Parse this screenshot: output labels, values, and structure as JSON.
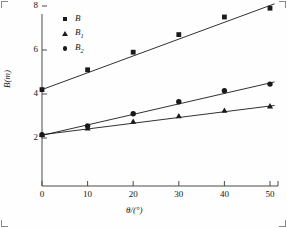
{
  "chart_data": {
    "type": "scatter",
    "title": "",
    "xlabel": "θ/(°)",
    "ylabel": "B(m)",
    "x": [
      0,
      10,
      20,
      30,
      40,
      50
    ],
    "xlim": [
      0,
      52
    ],
    "ylim": [
      1.0,
      8.4
    ],
    "xticks": [
      "0",
      "10",
      "20",
      "30",
      "40",
      "50"
    ],
    "yticks": [
      "2",
      "4",
      "6",
      "8"
    ],
    "ytick_values": [
      2,
      4,
      6,
      8
    ],
    "grid": false,
    "legend_position": "top-left",
    "series": [
      {
        "name": "B",
        "label": "B",
        "sub": "",
        "marker": "square",
        "color": "#1a1a1a",
        "values": [
          4.2,
          5.1,
          5.9,
          6.7,
          7.5,
          7.9
        ],
        "fit_start": 4.2,
        "fit_end": 8.1
      },
      {
        "name": "B1",
        "label": "B",
        "sub": "1",
        "marker": "triangle",
        "color": "#1a1a1a",
        "values": [
          2.15,
          2.45,
          2.75,
          3.0,
          3.25,
          3.45
        ],
        "fit_start": 2.15,
        "fit_end": 3.48
      },
      {
        "name": "B2",
        "label": "B",
        "sub": "2",
        "marker": "circle",
        "color": "#1a1a1a",
        "values": [
          2.15,
          2.55,
          3.1,
          3.65,
          4.15,
          4.45
        ],
        "fit_start": 2.12,
        "fit_end": 4.55
      }
    ]
  },
  "axes": {
    "y_axis_label": "B(m)",
    "x_axis_label": "θ/(°)"
  },
  "legend": {
    "entries": [
      {
        "label": "B",
        "sub": "",
        "marker": "square-marker"
      },
      {
        "label": "B",
        "sub": "1",
        "marker": "triangle-marker"
      },
      {
        "label": "B",
        "sub": "2",
        "marker": "circle-marker"
      }
    ]
  }
}
